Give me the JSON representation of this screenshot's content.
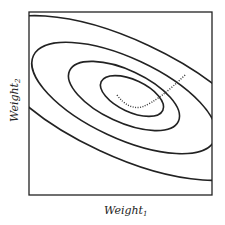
{
  "diagram": {
    "type": "contour-plot",
    "x_label": "Weight",
    "x_label_sub": "1",
    "y_label": "Weight",
    "y_label_sub": "2",
    "contours": 4,
    "path_style": "dotted",
    "colors": {
      "line": "#222222",
      "background": "#ffffff"
    }
  }
}
